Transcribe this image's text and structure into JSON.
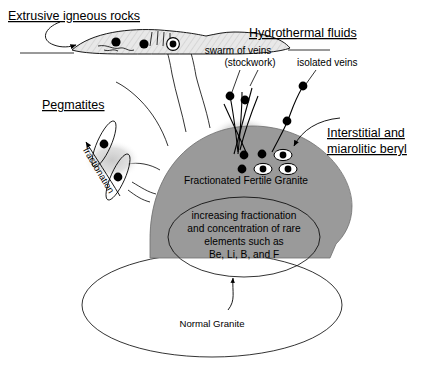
{
  "diagram": {
    "title_extrusive": "Extrusive igneous rocks",
    "title_hydrothermal": "Hydrothermal fluids",
    "title_pegmatites": "Pegmatites",
    "title_interstitial_line1": "Interstitial and",
    "title_interstitial_line2": "miarolitic beryl",
    "label_swarm_line1": "swarm of veins",
    "label_swarm_line2": "(stockwork)",
    "label_isolated_veins": "isolated veins",
    "label_fractionated_granite": "Fractionated Fertile Granite",
    "label_normal_granite": "Normal Granite",
    "label_fractionation_arrow": "fractionation",
    "inner_text_line1": "increasing fractionation",
    "inner_text_line2": "and concentration of rare",
    "inner_text_line3": "elements such as",
    "inner_text_line4": "Be, Li, B, and F"
  },
  "colors": {
    "background": "#ffffff",
    "granite_dome": "#9a9a9a",
    "halo": "#d8d8d8",
    "pegmatite_smudge": "#d2d2d2",
    "extrusive_fill": "#e4e4e4",
    "outline": "#000000",
    "text": "#000000"
  },
  "symbols": {
    "beryl_crystal": "black-dot",
    "miarolitic_beryl": "dot-in-white-ellipse"
  }
}
